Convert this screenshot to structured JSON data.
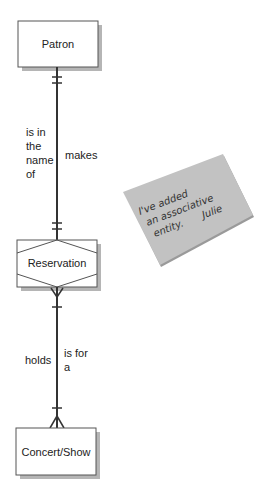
{
  "diagram": {
    "type": "entity-relationship",
    "entities": [
      {
        "id": "patron",
        "label": "Patron",
        "kind": "entity"
      },
      {
        "id": "reservation",
        "label": "Reservation",
        "kind": "associative-entity"
      },
      {
        "id": "concert",
        "label": "Concert/Show",
        "kind": "entity"
      }
    ],
    "relationships": [
      {
        "from": "patron",
        "to": "reservation",
        "label_left": [
          "is in",
          "the",
          "name",
          "of"
        ],
        "label_right": [
          "makes"
        ],
        "from_cardinality": "one-and-only-one",
        "to_cardinality": "one-and-only-one"
      },
      {
        "from": "reservation",
        "to": "concert",
        "label_left": [
          "holds"
        ],
        "label_right": [
          "is for",
          "a"
        ],
        "from_cardinality": "one-or-many",
        "to_cardinality": "one-or-many"
      }
    ],
    "note": {
      "lines": [
        "I've added",
        "an associative",
        "entity."
      ],
      "signature": "Julie"
    }
  },
  "colors": {
    "line": "#333333",
    "box_fill": "#ffffff",
    "box_border": "#555555",
    "shadow": "#b5b5b5",
    "note_fill": "#c2c2c2",
    "note_edge": "#9a9a9a"
  }
}
